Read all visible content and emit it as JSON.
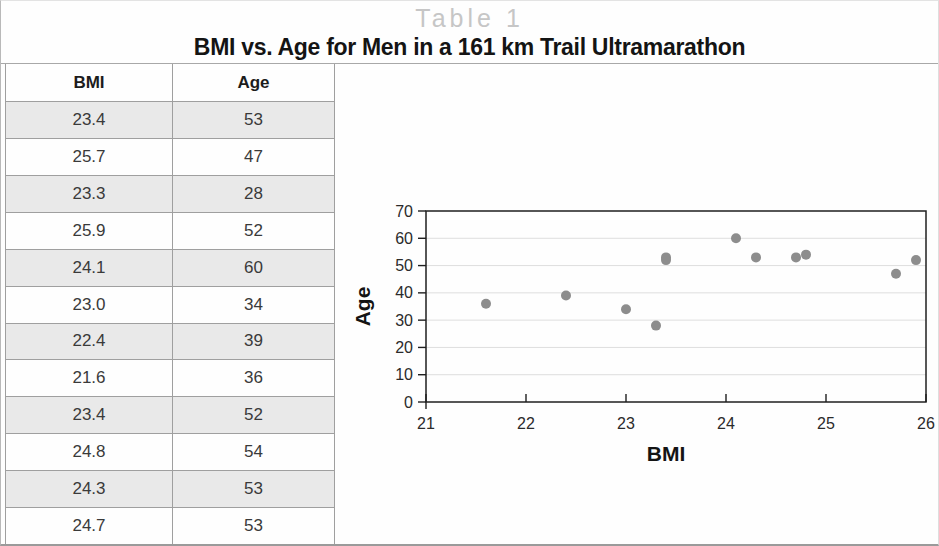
{
  "figure": {
    "table_number": "Table 1",
    "title": "BMI vs. Age for Men in a 161 km Trail Ultramarathon"
  },
  "table": {
    "columns": [
      "BMI",
      "Age"
    ],
    "rows": [
      [
        "23.4",
        "53"
      ],
      [
        "25.7",
        "47"
      ],
      [
        "23.3",
        "28"
      ],
      [
        "25.9",
        "52"
      ],
      [
        "24.1",
        "60"
      ],
      [
        "23.0",
        "34"
      ],
      [
        "22.4",
        "39"
      ],
      [
        "21.6",
        "36"
      ],
      [
        "23.4",
        "52"
      ],
      [
        "24.8",
        "54"
      ],
      [
        "24.3",
        "53"
      ],
      [
        "24.7",
        "53"
      ]
    ]
  },
  "chart_data": {
    "type": "scatter",
    "title": "",
    "xlabel": "BMI",
    "ylabel": "Age",
    "xlim": [
      21,
      26
    ],
    "ylim": [
      0,
      70
    ],
    "x_ticks": [
      21,
      22,
      23,
      24,
      25,
      26
    ],
    "y_ticks": [
      0,
      10,
      20,
      30,
      40,
      50,
      60,
      70
    ],
    "grid": "horizontal",
    "legend": "none",
    "points": [
      {
        "x": 23.4,
        "y": 53
      },
      {
        "x": 25.7,
        "y": 47
      },
      {
        "x": 23.3,
        "y": 28
      },
      {
        "x": 25.9,
        "y": 52
      },
      {
        "x": 24.1,
        "y": 60
      },
      {
        "x": 23.0,
        "y": 34
      },
      {
        "x": 22.4,
        "y": 39
      },
      {
        "x": 21.6,
        "y": 36
      },
      {
        "x": 23.4,
        "y": 52
      },
      {
        "x": 24.8,
        "y": 54
      },
      {
        "x": 24.3,
        "y": 53
      },
      {
        "x": 24.7,
        "y": 53
      }
    ]
  },
  "colors": {
    "point": "#8d8d8d",
    "grid": "#dedede",
    "axis": "#1f1f1f",
    "tick_text": "#2b2b2b",
    "row_shade": "#e9e9e9",
    "table_number_gray": "#c6c6c6"
  }
}
